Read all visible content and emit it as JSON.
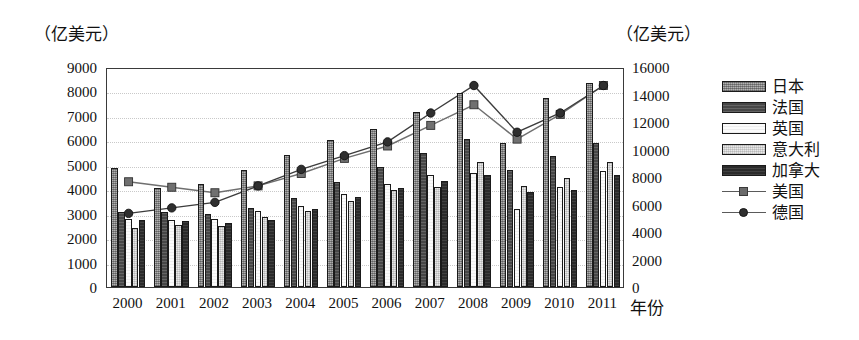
{
  "axis_titles": {
    "left_unit": "（亿美元）",
    "right_unit": "（亿美元）",
    "x_title": "年份"
  },
  "legend": {
    "items": [
      {
        "label": "日本",
        "kind": "bar",
        "swatch": "medium-gray-hatch"
      },
      {
        "label": "法国",
        "kind": "bar",
        "swatch": "dark-gray-hatch"
      },
      {
        "label": "英国",
        "kind": "bar",
        "swatch": "white"
      },
      {
        "label": "意大利",
        "kind": "bar",
        "swatch": "light-gray-hatch"
      },
      {
        "label": "加拿大",
        "kind": "bar",
        "swatch": "black"
      },
      {
        "label": "美国",
        "kind": "line",
        "swatch": "line-square-marker"
      },
      {
        "label": "德国",
        "kind": "line",
        "swatch": "line-circle-marker"
      }
    ]
  },
  "chart_data": {
    "type": "bar",
    "title": "",
    "xlabel": "年份",
    "ylabel": "（亿美元）",
    "grid": true,
    "legend_position": "right",
    "categories": [
      "2000",
      "2001",
      "2002",
      "2003",
      "2004",
      "2005",
      "2006",
      "2007",
      "2008",
      "2009",
      "2010",
      "2011"
    ],
    "left_axis": {
      "label": "（亿美元）",
      "min": 0,
      "max": 9000,
      "step": 1000,
      "ticks": [
        "9000",
        "8000",
        "7000",
        "6000",
        "5000",
        "4000",
        "3000",
        "2000",
        "1000",
        "0"
      ],
      "applies_to": [
        "日本",
        "法国",
        "英国",
        "意大利",
        "加拿大"
      ]
    },
    "right_axis": {
      "label": "（亿美元）",
      "min": 0,
      "max": 16000,
      "step": 2000,
      "ticks": [
        "16000",
        "14000",
        "12000",
        "10000",
        "8000",
        "6000",
        "4000",
        "2000",
        "0"
      ],
      "applies_to": [
        "美国",
        "德国"
      ]
    },
    "series": [
      {
        "name": "日本",
        "kind": "bar",
        "axis": "left",
        "values": [
          4850,
          4050,
          4200,
          4800,
          5400,
          6000,
          6450,
          7150,
          7950,
          5900,
          7750,
          8350
        ]
      },
      {
        "name": "法国",
        "kind": "bar",
        "axis": "left",
        "values": [
          3050,
          3050,
          3000,
          3250,
          3650,
          4300,
          4900,
          5500,
          6050,
          4800,
          5350,
          5900
        ]
      },
      {
        "name": "英国",
        "kind": "bar",
        "axis": "left",
        "values": [
          2800,
          2750,
          2800,
          3100,
          3300,
          3800,
          4200,
          4600,
          4650,
          3200,
          4100,
          4750
        ]
      },
      {
        "name": "意大利",
        "kind": "bar",
        "axis": "left",
        "values": [
          2400,
          2550,
          2500,
          2850,
          3100,
          3500,
          3950,
          4100,
          5100,
          4150,
          4450,
          5100
        ]
      },
      {
        "name": "加拿大",
        "kind": "bar",
        "axis": "left",
        "values": [
          2750,
          2700,
          2600,
          2750,
          3200,
          3700,
          4050,
          4350,
          4600,
          3900,
          3950,
          4600
        ]
      },
      {
        "name": "美国",
        "kind": "line",
        "axis": "right",
        "marker": "square",
        "values": [
          7800,
          7400,
          7000,
          7500,
          8400,
          9500,
          10400,
          11900,
          13400,
          10900,
          12700,
          14800
        ]
      },
      {
        "name": "德国",
        "kind": "line",
        "axis": "right",
        "marker": "circle",
        "values": [
          5500,
          5900,
          6300,
          7500,
          8700,
          9700,
          10700,
          12800,
          14800,
          11400,
          12800,
          14800
        ]
      }
    ]
  }
}
